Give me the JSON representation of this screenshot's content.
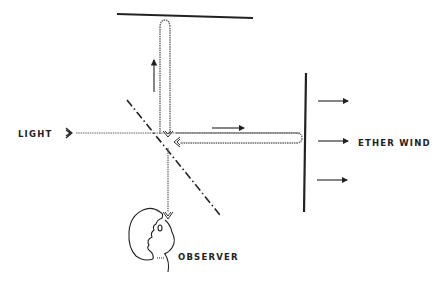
{
  "diagram": {
    "labels": {
      "light": "LIGHT",
      "ether_wind": "ETHER WIND",
      "observer": "OBSERVER"
    },
    "elements": [
      {
        "id": "top-mirror",
        "type": "mirror",
        "orientation": "horizontal"
      },
      {
        "id": "right-mirror",
        "type": "mirror",
        "orientation": "vertical"
      },
      {
        "id": "beam-splitter",
        "type": "half-silvered-mirror",
        "orientation": "diagonal"
      },
      {
        "id": "light-source-arrow",
        "type": "arrow"
      },
      {
        "id": "vertical-beam-path",
        "type": "beam"
      },
      {
        "id": "horizontal-beam-path",
        "type": "beam"
      },
      {
        "id": "observer-face",
        "type": "illustration"
      }
    ],
    "ether_wind_arrows": 3,
    "colors": {
      "ink": "#222222",
      "beam": "#555555",
      "background": "#ffffff"
    }
  }
}
